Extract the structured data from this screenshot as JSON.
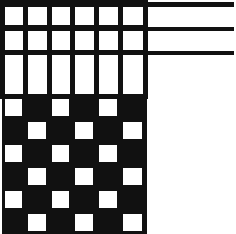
{
  "figure": {
    "width": 236,
    "height": 234,
    "background_color": "#ffffff",
    "ink_color": "#111111"
  },
  "geometry": {
    "grid_left": 2,
    "grid_right": 145,
    "column_edges": [
      2,
      25,
      49,
      72,
      96,
      120,
      145
    ],
    "upper_row_edges": [
      2,
      27,
      52,
      96
    ],
    "checker_row_edges": [
      96,
      119,
      142,
      165,
      188,
      211,
      234
    ],
    "line_weight_thick": 5,
    "line_weight_thin": 3,
    "rule_right_edge": 234
  },
  "chart_data": {
    "type": "heatmap",
    "xlabel": "",
    "ylabel": "",
    "grid": true,
    "legend": "none",
    "columns": 6,
    "rows": 9,
    "value_labels": {
      "0": "open",
      "1": "filled"
    },
    "row_kinds": [
      "open-grid",
      "open-grid",
      "open-grid-tall",
      "checker",
      "checker",
      "checker",
      "checker",
      "checker",
      "checker-clipped"
    ],
    "cells": [
      [
        0,
        0,
        0,
        0,
        0,
        0
      ],
      [
        0,
        0,
        0,
        0,
        0,
        0
      ],
      [
        0,
        0,
        0,
        0,
        0,
        0
      ],
      [
        0,
        1,
        0,
        1,
        0,
        1
      ],
      [
        1,
        0,
        1,
        0,
        1,
        0
      ],
      [
        0,
        1,
        0,
        1,
        0,
        1
      ],
      [
        1,
        0,
        1,
        0,
        1,
        0
      ],
      [
        0,
        1,
        0,
        1,
        0,
        1
      ],
      [
        1,
        0,
        1,
        0,
        1,
        0
      ]
    ],
    "horizontal_rules": [
      {
        "name": "rule-top",
        "y": 4,
        "x_start": 2,
        "x_end": 234,
        "weight": 5
      },
      {
        "name": "rule-middle",
        "y": 29,
        "x_start": 2,
        "x_end": 234,
        "weight": 4
      },
      {
        "name": "rule-lower",
        "y": 53,
        "x_start": 2,
        "x_end": 234,
        "weight": 4
      }
    ],
    "annotations": []
  }
}
